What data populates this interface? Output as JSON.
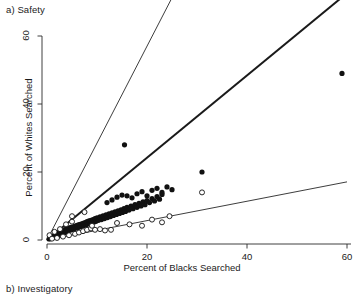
{
  "figure": {
    "panel_a_label": "a) Safety",
    "panel_b_label": "b) Investigatory"
  },
  "chart_data": {
    "type": "scatter",
    "title": "a) Safety",
    "xlabel": "Percent of Blacks Searched",
    "ylabel": "Percent of Whites Searched",
    "xlim": [
      0,
      62
    ],
    "ylim": [
      0,
      62
    ],
    "xticks": [
      0,
      20,
      40,
      60
    ],
    "yticks": [
      0,
      20,
      40,
      60
    ],
    "grid": false,
    "legend": "none",
    "series": [
      {
        "name": "filled-points",
        "marker": "filled-circle",
        "color": "#111111",
        "points": [
          [
            0.4,
            0.3
          ],
          [
            0.6,
            0.5
          ],
          [
            0.7,
            0.4
          ],
          [
            0.8,
            0.7
          ],
          [
            0.9,
            0.5
          ],
          [
            1.0,
            0.8
          ],
          [
            1.1,
            0.6
          ],
          [
            1.2,
            1.0
          ],
          [
            1.3,
            0.7
          ],
          [
            1.4,
            1.1
          ],
          [
            1.5,
            0.9
          ],
          [
            1.6,
            1.3
          ],
          [
            1.7,
            1.0
          ],
          [
            1.8,
            1.4
          ],
          [
            1.9,
            1.1
          ],
          [
            2.0,
            1.6
          ],
          [
            2.1,
            1.2
          ],
          [
            2.2,
            1.8
          ],
          [
            2.3,
            1.4
          ],
          [
            2.4,
            2.0
          ],
          [
            2.5,
            1.5
          ],
          [
            2.6,
            2.1
          ],
          [
            2.7,
            1.7
          ],
          [
            2.8,
            2.3
          ],
          [
            2.9,
            1.8
          ],
          [
            3.0,
            2.5
          ],
          [
            3.1,
            2.0
          ],
          [
            3.2,
            2.6
          ],
          [
            3.3,
            2.1
          ],
          [
            3.4,
            2.8
          ],
          [
            3.5,
            2.2
          ],
          [
            3.6,
            3.0
          ],
          [
            3.7,
            2.4
          ],
          [
            3.8,
            3.1
          ],
          [
            3.9,
            2.5
          ],
          [
            4.0,
            3.3
          ],
          [
            4.2,
            2.7
          ],
          [
            4.4,
            3.5
          ],
          [
            4.6,
            2.9
          ],
          [
            4.8,
            3.7
          ],
          [
            5.0,
            3.1
          ],
          [
            5.2,
            3.9
          ],
          [
            5.4,
            3.3
          ],
          [
            5.6,
            4.1
          ],
          [
            5.8,
            3.5
          ],
          [
            6.0,
            4.3
          ],
          [
            6.2,
            3.7
          ],
          [
            6.4,
            4.5
          ],
          [
            6.6,
            3.9
          ],
          [
            6.8,
            4.7
          ],
          [
            7.0,
            4.1
          ],
          [
            7.2,
            4.9
          ],
          [
            7.4,
            4.3
          ],
          [
            7.6,
            5.1
          ],
          [
            7.8,
            4.5
          ],
          [
            8.0,
            5.4
          ],
          [
            8.2,
            4.7
          ],
          [
            8.4,
            5.6
          ],
          [
            8.6,
            4.9
          ],
          [
            8.8,
            5.8
          ],
          [
            9.0,
            5.1
          ],
          [
            9.2,
            6.0
          ],
          [
            9.4,
            5.3
          ],
          [
            9.6,
            6.3
          ],
          [
            9.8,
            5.5
          ],
          [
            10.0,
            6.5
          ],
          [
            10.3,
            5.8
          ],
          [
            10.6,
            6.8
          ],
          [
            10.9,
            6.0
          ],
          [
            11.2,
            7.1
          ],
          [
            11.5,
            6.3
          ],
          [
            11.8,
            7.4
          ],
          [
            12.1,
            6.6
          ],
          [
            12.4,
            7.7
          ],
          [
            12.7,
            6.9
          ],
          [
            13.0,
            8.0
          ],
          [
            13.3,
            7.2
          ],
          [
            13.6,
            8.3
          ],
          [
            13.9,
            7.5
          ],
          [
            14.2,
            8.6
          ],
          [
            14.5,
            7.8
          ],
          [
            14.8,
            8.9
          ],
          [
            15.1,
            8.1
          ],
          [
            15.4,
            9.2
          ],
          [
            15.7,
            8.4
          ],
          [
            16.0,
            9.6
          ],
          [
            16.4,
            8.8
          ],
          [
            16.8,
            10.0
          ],
          [
            17.2,
            9.2
          ],
          [
            17.6,
            10.4
          ],
          [
            18.0,
            9.6
          ],
          [
            18.4,
            10.8
          ],
          [
            18.8,
            10.0
          ],
          [
            19.2,
            11.2
          ],
          [
            19.6,
            10.4
          ],
          [
            20.0,
            11.6
          ],
          [
            20.5,
            11.0
          ],
          [
            21.0,
            12.2
          ],
          [
            21.5,
            11.5
          ],
          [
            22.0,
            12.8
          ],
          [
            22.5,
            12.0
          ],
          [
            23.0,
            13.4
          ],
          [
            12.0,
            11.0
          ],
          [
            13.0,
            11.8
          ],
          [
            14.0,
            12.6
          ],
          [
            15.0,
            13.2
          ],
          [
            16.0,
            13.0
          ],
          [
            17.0,
            12.4
          ],
          [
            18.0,
            13.6
          ],
          [
            19.0,
            14.2
          ],
          [
            20.0,
            13.0
          ],
          [
            21.0,
            14.6
          ],
          [
            22.0,
            15.2
          ],
          [
            23.0,
            14.0
          ],
          [
            24.0,
            15.6
          ],
          [
            25.0,
            14.8
          ],
          [
            15.5,
            28.0
          ],
          [
            31.0,
            20.0
          ],
          [
            59.0,
            49.0
          ]
        ]
      },
      {
        "name": "open-points",
        "marker": "open-circle",
        "color": "#111111",
        "points": [
          [
            0.5,
            1.4
          ],
          [
            1.0,
            0.4
          ],
          [
            1.5,
            2.4
          ],
          [
            2.0,
            0.6
          ],
          [
            2.6,
            3.2
          ],
          [
            3.2,
            1.0
          ],
          [
            3.8,
            4.6
          ],
          [
            4.4,
            1.4
          ],
          [
            5.0,
            5.4
          ],
          [
            5.6,
            1.8
          ],
          [
            6.4,
            2.2
          ],
          [
            7.2,
            2.6
          ],
          [
            8.0,
            3.0
          ],
          [
            8.8,
            3.4
          ],
          [
            9.6,
            3.0
          ],
          [
            10.6,
            3.2
          ],
          [
            11.6,
            2.8
          ],
          [
            12.8,
            3.0
          ],
          [
            5.0,
            7.0
          ],
          [
            7.5,
            8.2
          ],
          [
            9.0,
            4.2
          ],
          [
            14.0,
            5.0
          ],
          [
            16.5,
            4.6
          ],
          [
            19.0,
            4.2
          ],
          [
            21.0,
            6.0
          ],
          [
            23.0,
            5.2
          ],
          [
            24.5,
            7.0
          ],
          [
            31.0,
            14.0
          ]
        ]
      }
    ],
    "lines": [
      {
        "name": "upper-reference-line",
        "slope": 2.85,
        "intercept": 0,
        "width": "thin",
        "x_end": 51.5
      },
      {
        "name": "fit-line",
        "slope": 1.21,
        "intercept": 0,
        "width": "thick",
        "x_end": 60.0
      },
      {
        "name": "lower-reference-line",
        "slope": 0.285,
        "intercept": 0,
        "width": "thin",
        "x_end": 60.0
      }
    ],
    "axis_tick_labels_x": [
      "0",
      "20",
      "40",
      "60"
    ],
    "axis_tick_labels_y": [
      "0",
      "20",
      "40",
      "60"
    ]
  }
}
